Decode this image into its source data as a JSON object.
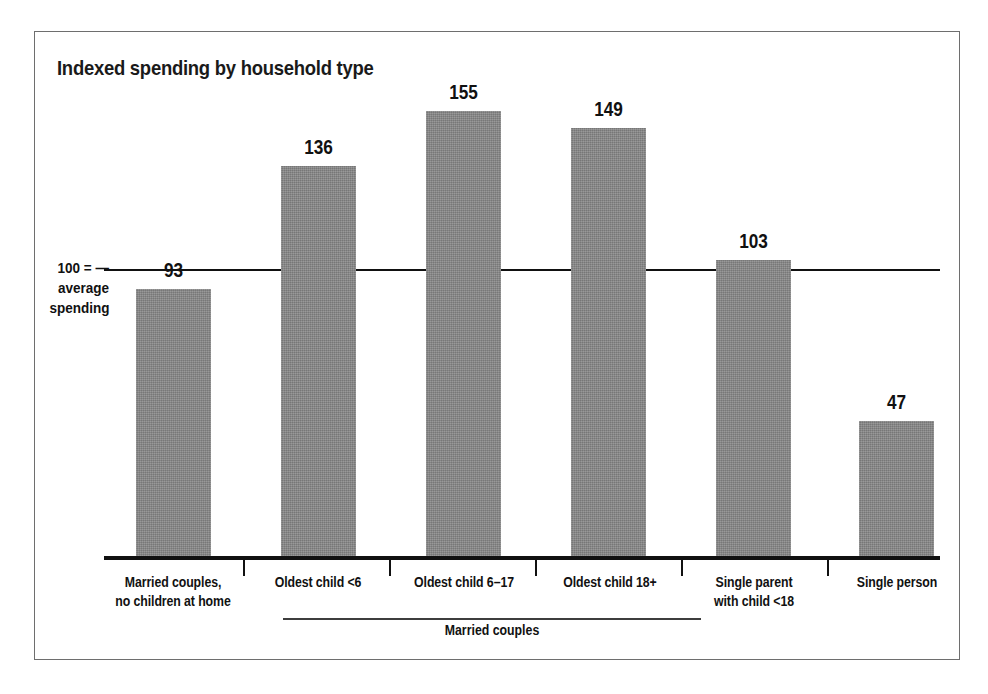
{
  "chart_data": {
    "type": "bar",
    "title": "Indexed spending by household type",
    "xlabel": "",
    "ylabel": "",
    "ylim": [
      0,
      160
    ],
    "grid": false,
    "legend": "none",
    "reference_line": {
      "value": 100,
      "label_lines": [
        "100 = —",
        "average",
        "spending"
      ]
    },
    "categories": [
      "Married couples, no children at home",
      "Oldest child <6",
      "Oldest child 6–17",
      "Oldest child 18+",
      "Single parent with child <18",
      "Single person"
    ],
    "category_label_lines": [
      [
        "Married couples,",
        "no children at home"
      ],
      [
        "Oldest child <6"
      ],
      [
        "Oldest child 6–17"
      ],
      [
        "Oldest child 18+"
      ],
      [
        "Single parent",
        "with child <18"
      ],
      [
        "Single person"
      ]
    ],
    "values": [
      93,
      136,
      155,
      149,
      103,
      47
    ],
    "value_labels": [
      "93",
      "136",
      "155",
      "149",
      "103",
      "47"
    ],
    "group_brackets": [
      {
        "label": "Married couples",
        "spans_categories": [
          "Oldest child <6",
          "Oldest child 6–17",
          "Oldest child 18+"
        ]
      }
    ],
    "colors": {
      "bar_fill": "#838383",
      "axis": "#111111",
      "text": "#111111",
      "frame_border": "#6e6e6e",
      "background": "#ffffff"
    }
  }
}
